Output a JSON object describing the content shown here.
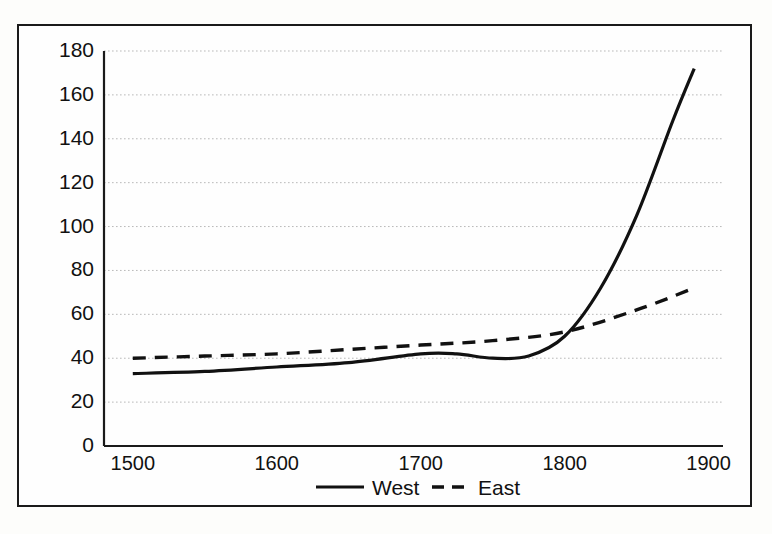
{
  "chart_data": {
    "type": "line",
    "title": "",
    "subtitle": "",
    "xlabel": "",
    "ylabel": "",
    "xlim": [
      1480,
      1910
    ],
    "ylim": [
      0,
      180
    ],
    "grid": true,
    "grid_axis": "y",
    "legend_position": "bottom-center",
    "x_ticks": [
      1500,
      1600,
      1700,
      1800,
      1900
    ],
    "x_tick_labels": [
      "1500",
      "1600",
      "1700",
      "1800",
      "1900"
    ],
    "y_ticks": [
      0,
      20,
      40,
      60,
      80,
      100,
      120,
      140,
      160,
      180
    ],
    "y_tick_labels": [
      "0",
      "20",
      "40",
      "60",
      "80",
      "100",
      "120",
      "140",
      "160",
      "180"
    ],
    "series": [
      {
        "name": "West",
        "style": "solid",
        "color": "#111111",
        "x": [
          1500,
          1550,
          1600,
          1650,
          1700,
          1725,
          1750,
          1775,
          1800,
          1825,
          1850,
          1875,
          1890
        ],
        "values": [
          33,
          34,
          36,
          38,
          42,
          42,
          40,
          41,
          50,
          72,
          105,
          148,
          172
        ]
      },
      {
        "name": "East",
        "style": "dashed",
        "color": "#111111",
        "x": [
          1500,
          1550,
          1600,
          1650,
          1700,
          1750,
          1800,
          1850,
          1890
        ],
        "values": [
          40,
          41,
          42,
          44,
          46,
          48,
          52,
          62,
          72
        ]
      }
    ]
  },
  "legend": {
    "items": [
      {
        "label": "West",
        "style": "solid"
      },
      {
        "label": "East",
        "style": "dashed"
      }
    ]
  },
  "colors": {
    "line": "#111111",
    "axis": "#1a1a1a",
    "grid": "#b9b9b9",
    "frame": "#1a1a1a",
    "background": "#fefefe"
  }
}
